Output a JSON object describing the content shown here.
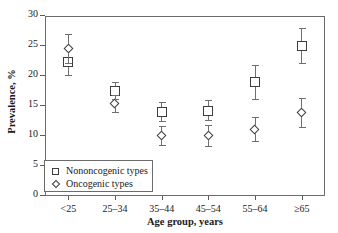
{
  "chart_data": {
    "type": "scatter",
    "title": "",
    "xlabel": "Age group, years",
    "ylabel": "Prevalence, %",
    "categories": [
      "<25",
      "25–34",
      "35–44",
      "45–54",
      "55–64",
      "≥65"
    ],
    "ylim": [
      0,
      30
    ],
    "yticks": [
      0,
      5,
      10,
      15,
      20,
      25,
      30
    ],
    "ytick_labels": [
      "0",
      "5",
      "10",
      "15",
      "20",
      "25",
      "30"
    ],
    "grid": false,
    "legend_position": "lower-left-inside",
    "series": [
      {
        "name": "Nononcogenic types",
        "marker": "square",
        "values": [
          22.3,
          17.5,
          14.0,
          14.2,
          19.0,
          25.0
        ],
        "ci_low": [
          20.1,
          16.1,
          12.5,
          12.6,
          16.2,
          22.1
        ],
        "ci_high": [
          24.6,
          19.0,
          15.6,
          16.0,
          21.8,
          28.0
        ]
      },
      {
        "name": "Oncogenic types",
        "marker": "diamond",
        "values": [
          24.5,
          15.4,
          10.1,
          10.0,
          11.1,
          13.9
        ],
        "ci_low": [
          22.1,
          14.0,
          8.5,
          8.3,
          9.1,
          11.5
        ],
        "ci_high": [
          27.0,
          16.8,
          11.7,
          11.8,
          13.2,
          16.4
        ]
      }
    ]
  },
  "legend": {
    "entries": [
      {
        "label": "Nononcogenic types",
        "marker": "square"
      },
      {
        "label": "Oncogenic types",
        "marker": "diamond"
      }
    ]
  },
  "colors": {
    "axis": "#6b6b6b",
    "marker_edge": "#3d3d3d",
    "errorbar": "#6e6e6e",
    "text": "#1a1a1a",
    "background": "#ffffff"
  }
}
